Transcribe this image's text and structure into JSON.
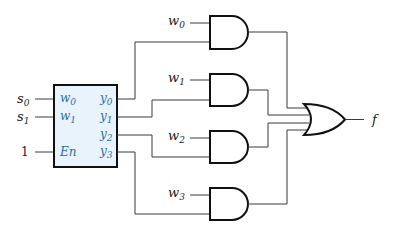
{
  "diagram": {
    "type": "circuit",
    "colors": {
      "wire": "#3a3a3a",
      "gate_stroke": "#111111",
      "decoder_fill": "#e9f3fb",
      "port_label": "#2b6cb0"
    },
    "decoder": {
      "inputs": [
        {
          "external": "s",
          "external_sub": "0",
          "port": "w",
          "port_sub": "0"
        },
        {
          "external": "s",
          "external_sub": "1",
          "port": "w",
          "port_sub": "1"
        },
        {
          "external": "1",
          "port": "En"
        }
      ],
      "outputs": [
        {
          "port": "y",
          "port_sub": "0"
        },
        {
          "port": "y",
          "port_sub": "1"
        },
        {
          "port": "y",
          "port_sub": "2"
        },
        {
          "port": "y",
          "port_sub": "3"
        }
      ]
    },
    "and_gates": [
      {
        "data_input": "w",
        "sub": "0",
        "select": "y0"
      },
      {
        "data_input": "w",
        "sub": "1",
        "select": "y1"
      },
      {
        "data_input": "w",
        "sub": "2",
        "select": "y2"
      },
      {
        "data_input": "w",
        "sub": "3",
        "select": "y3"
      }
    ],
    "or_gate": {
      "inputs": 4,
      "output": "f"
    }
  }
}
